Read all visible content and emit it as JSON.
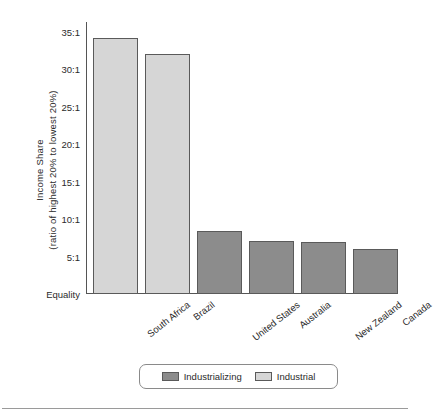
{
  "chart_data": {
    "type": "bar",
    "title": "",
    "xlabel": "",
    "ylabel_line1": "Income Share",
    "ylabel_line2": "(ratio of highest 20% to lowest 20%)",
    "categories": [
      "South Africa",
      "Brazil",
      "United States",
      "Australia",
      "New Zealand",
      "Canada"
    ],
    "values": [
      34.2,
      32.0,
      8.4,
      7.1,
      6.9,
      6.0
    ],
    "group": [
      "Industrial",
      "Industrial",
      "Industrializing",
      "Industrializing",
      "Industrializing",
      "Industrializing"
    ],
    "ylim": [
      0,
      36.3
    ],
    "ytick_values": [
      0,
      5,
      10,
      15,
      20,
      25,
      30,
      35
    ],
    "ytick_labels": [
      "Equality",
      "5:1",
      "10:1",
      "15:1",
      "20:1",
      "25:1",
      "30:1",
      "35:1"
    ],
    "grid": false,
    "legend_position": "bottom-center",
    "legend": [
      {
        "name": "Industrializing",
        "color": "#8c8c8c"
      },
      {
        "name": "Industrial",
        "color": "#d6d6d6"
      }
    ],
    "colors": {
      "industrial": "#d6d6d6",
      "industrializing": "#8c8c8c",
      "bar_border": "#5a5a5a",
      "axis": "#555555",
      "text": "#2b2b2b",
      "legend_border": "#8a8a8a",
      "bottom_rule": "#9a9a9a"
    }
  }
}
